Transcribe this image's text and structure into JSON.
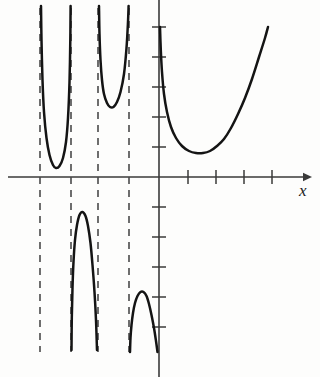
{
  "figure": {
    "name": "graph-of-periodic-rational-function",
    "background_color": "#fdfdfc",
    "curve_color": "#141414",
    "axis_color": "#3a3a3a",
    "asymptote_color": "#4a4a4a"
  },
  "axes": {
    "x_axis": {
      "label": "x",
      "label_x": 299,
      "label_y": 182,
      "y_pixel": 177,
      "x_start": 8,
      "x_end": 310,
      "arrow": "right",
      "tick_length": 7,
      "ticks_px": [
        188,
        216,
        244,
        272
      ]
    },
    "y_axis": {
      "label": "",
      "x_pixel": 159,
      "y_start": 0,
      "y_end": 377,
      "arrow": "none",
      "tick_length": 7,
      "ticks_px": [
        27,
        57,
        87,
        117,
        147,
        207,
        237,
        267,
        297,
        327
      ]
    }
  },
  "chart_data": {
    "type": "line",
    "title": "",
    "xlabel": "x",
    "ylabel": "",
    "grid": false,
    "legend": false,
    "xlim_px": [
      8,
      310
    ],
    "ylim_px": [
      0,
      377
    ],
    "origin_px": [
      159,
      177
    ],
    "asymptotes": {
      "type": "vertical-dashed",
      "x_px": [
        40,
        71,
        98,
        129
      ],
      "y_top_px": 8,
      "y_bottom_px": 352,
      "dash": "7 6"
    },
    "branches": [
      {
        "name": "upper-branch-1",
        "shape": "U",
        "points_px": [
          [
            41,
            6
          ],
          [
            41.5,
            40
          ],
          [
            42.5,
            80
          ],
          [
            44,
            112
          ],
          [
            46.5,
            138
          ],
          [
            49.5,
            155
          ],
          [
            53,
            165
          ],
          [
            56,
            168
          ],
          [
            59.5,
            166
          ],
          [
            63,
            158
          ],
          [
            66,
            142
          ],
          [
            68,
            118
          ],
          [
            69.5,
            82
          ],
          [
            70.3,
            40
          ],
          [
            70.6,
            6
          ]
        ]
      },
      {
        "name": "upper-branch-2",
        "shape": "U",
        "points_px": [
          [
            99,
            6
          ],
          [
            99.5,
            34
          ],
          [
            100.5,
            60
          ],
          [
            102,
            80
          ],
          [
            104,
            94
          ],
          [
            107,
            103
          ],
          [
            110,
            107
          ],
          [
            113.5,
            107
          ],
          [
            117,
            102
          ],
          [
            120.5,
            92
          ],
          [
            124,
            74
          ],
          [
            126.5,
            48
          ],
          [
            128,
            22
          ],
          [
            128.6,
            6
          ]
        ]
      },
      {
        "name": "lower-branch-1",
        "shape": "inverted-U",
        "points_px": [
          [
            71.5,
            350
          ],
          [
            71.8,
            318
          ],
          [
            72.5,
            288
          ],
          [
            73.5,
            262
          ],
          [
            75,
            240
          ],
          [
            77,
            225
          ],
          [
            79.5,
            215
          ],
          [
            82.5,
            212
          ],
          [
            85.5,
            216
          ],
          [
            88,
            226
          ],
          [
            90.5,
            243
          ],
          [
            92.5,
            265
          ],
          [
            94.5,
            292
          ],
          [
            96,
            320
          ],
          [
            97,
            350
          ]
        ]
      },
      {
        "name": "lower-branch-2",
        "shape": "inverted-U",
        "points_px": [
          [
            130,
            352
          ],
          [
            130.5,
            338
          ],
          [
            131.5,
            325
          ],
          [
            133,
            313
          ],
          [
            135,
            303
          ],
          [
            137.5,
            296
          ],
          [
            140.5,
            292
          ],
          [
            143.5,
            292
          ],
          [
            146.5,
            296
          ],
          [
            149,
            304
          ],
          [
            151.5,
            315
          ],
          [
            154,
            328
          ],
          [
            156,
            341
          ],
          [
            157.5,
            352
          ]
        ]
      },
      {
        "name": "right-branch",
        "shape": "U",
        "points_px": [
          [
            160,
            27
          ],
          [
            160.8,
            50
          ],
          [
            162,
            72
          ],
          [
            164,
            94
          ],
          [
            167,
            112
          ],
          [
            171,
            127
          ],
          [
            176,
            138
          ],
          [
            182,
            146
          ],
          [
            189,
            151
          ],
          [
            196,
            153
          ],
          [
            203,
            153
          ],
          [
            210,
            151
          ],
          [
            217,
            146
          ],
          [
            224,
            139
          ],
          [
            231,
            128
          ],
          [
            238,
            114
          ],
          [
            245,
            98
          ],
          [
            252,
            79
          ],
          [
            259,
            57
          ],
          [
            265,
            38
          ],
          [
            268,
            27
          ]
        ]
      }
    ]
  }
}
